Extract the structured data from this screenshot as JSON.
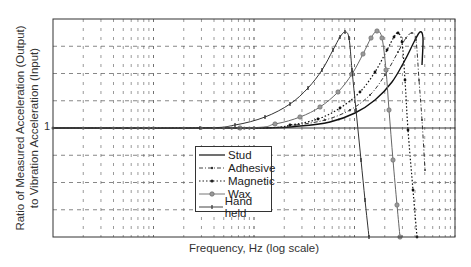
{
  "chart_data": {
    "type": "line",
    "title": "",
    "xlabel": "Frequency, Hz (log scale)",
    "ylabel": "Ratio of Measured Acceleration (Output)\nto Vibration Acceleration (Input)",
    "ylabel_lines": [
      "Ratio of Measured Acceleration (Output)",
      "to Vibration Acceleration (Input)"
    ],
    "y_tick_labels": [
      "1"
    ],
    "x_scale": "log",
    "x_decades": 4,
    "y_scale": "log",
    "grid": true,
    "legend_position": "center-bottom inside",
    "series": [
      {
        "name": "Stud",
        "style": "solid",
        "marker": "none",
        "points_px": [
          [
            53,
            128
          ],
          [
            254,
            128
          ],
          [
            300,
            126
          ],
          [
            330,
            122
          ],
          [
            355,
            113
          ],
          [
            375,
            100
          ],
          [
            392,
            82
          ],
          [
            405,
            60
          ],
          [
            414,
            42
          ],
          [
            420,
            32
          ],
          [
            423,
            38
          ],
          [
            422,
            65
          ]
        ]
      },
      {
        "name": "Adhesive",
        "style": "dashdot",
        "marker": "small-dot",
        "points_px": [
          [
            53,
            128
          ],
          [
            254,
            128
          ],
          [
            295,
            125
          ],
          [
            325,
            120
          ],
          [
            350,
            110
          ],
          [
            370,
            95
          ],
          [
            385,
            75
          ],
          [
            398,
            52
          ],
          [
            406,
            38
          ],
          [
            412,
            33
          ],
          [
            416,
            40
          ],
          [
            419,
            80
          ],
          [
            422,
            120
          ],
          [
            425,
            170
          ]
        ]
      },
      {
        "name": "Magnetic",
        "style": "dotted",
        "marker": "dot",
        "points_px": [
          [
            53,
            128
          ],
          [
            254,
            128
          ],
          [
            290,
            125
          ],
          [
            318,
            119
          ],
          [
            340,
            108
          ],
          [
            360,
            92
          ],
          [
            375,
            72
          ],
          [
            387,
            50
          ],
          [
            394,
            37
          ],
          [
            398,
            33
          ],
          [
            402,
            42
          ],
          [
            405,
            80
          ],
          [
            408,
            130
          ],
          [
            413,
            190
          ],
          [
            417,
            237
          ]
        ]
      },
      {
        "name": "Wax",
        "style": "solid",
        "marker": "circle",
        "points_px": [
          [
            53,
            128
          ],
          [
            240,
            128
          ],
          [
            275,
            124
          ],
          [
            300,
            117
          ],
          [
            320,
            107
          ],
          [
            338,
            92
          ],
          [
            352,
            74
          ],
          [
            363,
            54
          ],
          [
            371,
            38
          ],
          [
            377,
            31
          ],
          [
            382,
            38
          ],
          [
            386,
            70
          ],
          [
            389,
            110
          ],
          [
            393,
            160
          ],
          [
            397,
            205
          ],
          [
            400,
            237
          ]
        ]
      },
      {
        "name": "Hand held",
        "style": "solid",
        "marker": "tick",
        "points_px": [
          [
            53,
            128
          ],
          [
            200,
            128
          ],
          [
            235,
            125
          ],
          [
            265,
            117
          ],
          [
            290,
            104
          ],
          [
            308,
            88
          ],
          [
            322,
            70
          ],
          [
            333,
            50
          ],
          [
            340,
            37
          ],
          [
            345,
            32
          ],
          [
            349,
            38
          ],
          [
            352,
            70
          ],
          [
            356,
            110
          ],
          [
            361,
            160
          ],
          [
            365,
            200
          ],
          [
            369,
            237
          ]
        ]
      }
    ],
    "ylim_px": [
      19,
      237
    ],
    "xlim_px": [
      53,
      455
    ]
  },
  "legend": {
    "items": [
      {
        "label": "Stud"
      },
      {
        "label": "Adhesive"
      },
      {
        "label": "Magnetic"
      },
      {
        "label": "Wax"
      },
      {
        "label": "Hand held"
      }
    ]
  },
  "axes": {
    "xlabel": "Frequency, Hz (log scale)",
    "ylabel_line1": "Ratio of Measured Acceleration (Output)",
    "ylabel_line2": "to Vibration Acceleration (Input)",
    "ytick_one": "1"
  }
}
